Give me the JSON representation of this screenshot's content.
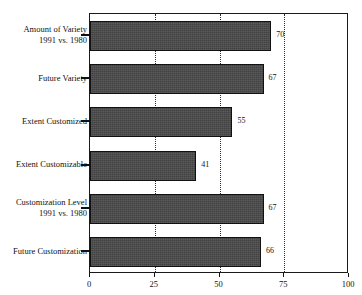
{
  "chart_data": {
    "type": "bar",
    "orientation": "horizontal",
    "title": "",
    "xlabel": "",
    "ylabel": "",
    "xlim": [
      0,
      100
    ],
    "xticks": [
      "0",
      "25",
      "50",
      "75",
      "100"
    ],
    "xtick_values": [
      0,
      25,
      50,
      75,
      100
    ],
    "gridlines": [
      25,
      50,
      75
    ],
    "grid": true,
    "legend": false,
    "bar_color": "#4a4a4a",
    "bar_edge_color": "#111111",
    "categories": [
      "Amount of Variety 1991 vs. 1980",
      "Future Variety",
      "Extent Customized",
      "Extent Customizable",
      "Customization Level 1991 vs. 1980",
      "Future Customization"
    ],
    "values": [
      70,
      67,
      55,
      41,
      67,
      66
    ],
    "bars": [
      {
        "label_line1": "Amount of Variety",
        "label_line2": "1991 vs. 1980",
        "value": 70,
        "value_text": "70"
      },
      {
        "label_line1": "Future Variety",
        "label_line2": "",
        "value": 67,
        "value_text": "67"
      },
      {
        "label_line1": "Extent Customized",
        "label_line2": "",
        "value": 55,
        "value_text": "55"
      },
      {
        "label_line1": "Extent Customizable",
        "label_line2": "",
        "value": 41,
        "value_text": "41"
      },
      {
        "label_line1": "Customization Level",
        "label_line2": "1991 vs. 1980",
        "value": 67,
        "value_text": "67"
      },
      {
        "label_line1": "Future Customization",
        "label_line2": "",
        "value": 66,
        "value_text": "66"
      }
    ]
  }
}
